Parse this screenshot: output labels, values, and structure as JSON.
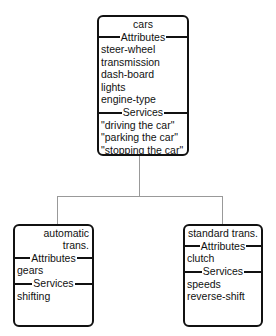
{
  "diagram": {
    "root": {
      "name": "cars",
      "attributes_label": "Attributes",
      "attributes": [
        "steer-wheel",
        "transmission",
        "dash-board",
        "lights",
        "engine-type"
      ],
      "services_label": "Services",
      "services": [
        "\"driving the car\"",
        "\"parking the car\"",
        "\"stopping the car\""
      ]
    },
    "children": [
      {
        "name": "automatic trans.",
        "attributes_label": "Attributes",
        "attributes": [
          "gears"
        ],
        "services_label": "Services",
        "services": [
          "shifting"
        ]
      },
      {
        "name": "standard trans.",
        "attributes_label": "Attributes",
        "attributes": [
          "clutch"
        ],
        "services_label": "Services",
        "services": [
          "speeds",
          "reverse-shift"
        ]
      }
    ]
  }
}
